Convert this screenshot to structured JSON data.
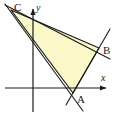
{
  "figure": {
    "type": "geometry-diagram",
    "background_color": "#ffffff",
    "stroke_color": "#1a1a1a",
    "fill_color": "#faf7c8",
    "fill_stroke_color": "#1a1a1a",
    "width": 116,
    "height": 117
  },
  "axes": {
    "x_axis": {
      "label": "x",
      "label_x": 101,
      "label_y": 73,
      "y": 88,
      "x_start": 5,
      "x_end": 112,
      "arrow": "right"
    },
    "y_axis": {
      "label": "y",
      "label_x": 36,
      "label_y": 3,
      "x": 33,
      "y_start": 4,
      "y_end": 112,
      "arrow": "up"
    },
    "origin": {
      "x": 33,
      "y": 88
    }
  },
  "vertices": [
    {
      "name": "A",
      "x": 73,
      "y": 93,
      "label": "A",
      "label_x": 77,
      "label_y": 94
    },
    {
      "name": "B",
      "x": 99,
      "y": 48,
      "label": "B",
      "label_x": 103,
      "label_y": 45
    },
    {
      "name": "C",
      "x": 11,
      "y": 10,
      "label": "C",
      "label_x": 14,
      "label_y": 2
    }
  ],
  "edges": [
    {
      "name": "side-AB",
      "from": "A",
      "to": "B"
    },
    {
      "name": "side-BC",
      "from": "B",
      "to": "C"
    },
    {
      "name": "side-CA",
      "from": "C",
      "to": "A"
    }
  ],
  "extended_lines": [
    {
      "name": "line-AB-extended",
      "x1": 66,
      "y1": 105,
      "x2": 110,
      "y2": 29
    },
    {
      "name": "line-BC-extended",
      "x1": 5,
      "y1": 5,
      "x2": 110,
      "y2": 59
    },
    {
      "name": "line-CA-extended",
      "x1": 5,
      "y1": 4,
      "x2": 83,
      "y2": 111
    }
  ],
  "chart_data": {
    "type": "scatter",
    "title": "",
    "xlabel": "x",
    "ylabel": "y",
    "points": [
      {
        "label": "A",
        "px": 73,
        "py": 93
      },
      {
        "label": "B",
        "px": 99,
        "py": 48
      },
      {
        "label": "C",
        "px": 11,
        "py": 10
      }
    ],
    "grid": false,
    "legend": "none"
  }
}
